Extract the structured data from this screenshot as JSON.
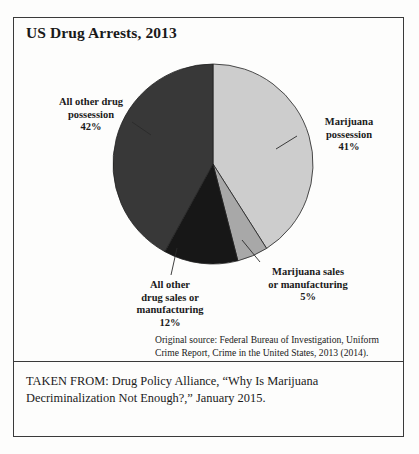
{
  "figure": {
    "title": "US Drug Arrests, 2013",
    "source_note": "Original source: Federal Bureau of Investigation, Uniform Crime Report, Crime in the United States, 2013 (2014).",
    "taken_from": "TAKEN FROM: Drug Policy Alliance, “Why Is Marijuana Decriminalization Not Enough?,” January 2015."
  },
  "labels": {
    "other_possession": "All other drug\npossession\n42%",
    "other_possession_line1": "All other drug",
    "other_possession_line2": "possession",
    "other_possession_line3": "42%",
    "mj_possession_line1": "Marijuana",
    "mj_possession_line2": "possession",
    "mj_possession_line3": "41%",
    "mj_sales_line1": "Marijuana sales",
    "mj_sales_line2": "or manufacturing",
    "mj_sales_line3": "5%",
    "other_sales_line1": "All other",
    "other_sales_line2": "drug sales or",
    "other_sales_line3": "manufacturing",
    "other_sales_line4": "12%"
  },
  "chart_data": {
    "type": "pie",
    "title": "US Drug Arrests, 2013",
    "xlabel": "",
    "ylabel": "",
    "legend_position": "none",
    "start_angle_deg": 0,
    "direction": "clockwise",
    "categories": [
      "Marijuana possession",
      "Marijuana sales or manufacturing",
      "All other drug sales or manufacturing",
      "All other drug possession"
    ],
    "values": [
      41,
      5,
      12,
      42
    ],
    "value_unit": "percent",
    "labels": [
      "41%",
      "5%",
      "12%",
      "42%"
    ],
    "colors": [
      "#cdcdcd",
      "#a8a8a8",
      "#171717",
      "#383838"
    ],
    "slice_border_color": "#222222",
    "total": 100
  }
}
